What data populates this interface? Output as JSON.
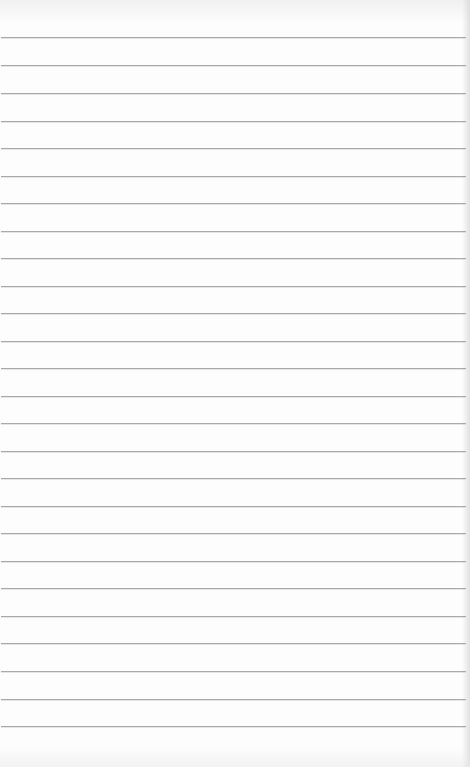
{
  "paper": {
    "type": "lined-paper",
    "background_color": "#fdfdfd",
    "rule_color": "#a9a9a9",
    "rule_count": 26,
    "rule_spacing_px": 27.5,
    "first_rule_y": 37,
    "rules_y": [
      37,
      65,
      93,
      121,
      148,
      176,
      203,
      231,
      258,
      286,
      313,
      341,
      368,
      396,
      423,
      451,
      478,
      506,
      533,
      561,
      588,
      616,
      643,
      671,
      699,
      726
    ]
  }
}
